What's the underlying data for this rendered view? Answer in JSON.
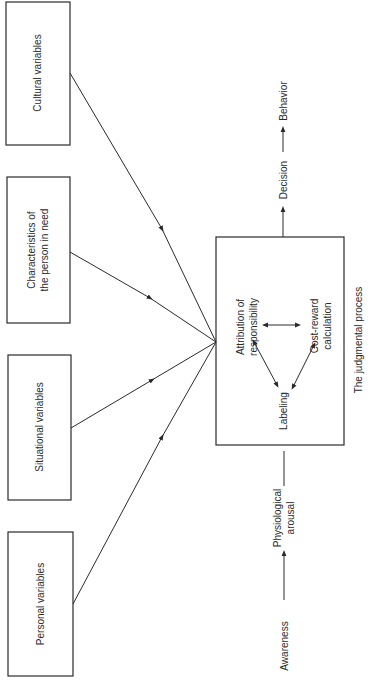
{
  "diagram": {
    "orientation": "rotated-90-ccw",
    "input_boxes": [
      {
        "id": "cultural",
        "lines": [
          "Cultural variables"
        ]
      },
      {
        "id": "characteristics",
        "lines": [
          "Characteristics of",
          "the person in need"
        ]
      },
      {
        "id": "situational",
        "lines": [
          "Situational variables"
        ]
      },
      {
        "id": "personal",
        "lines": [
          "Personal variables"
        ]
      }
    ],
    "process_box": {
      "caption": "The judgmental process",
      "nodes": {
        "attribution": [
          "Attribution of",
          "responsibility"
        ],
        "cost_reward": [
          "Cost-reward",
          "calculation"
        ],
        "labeling": [
          "Labeling"
        ]
      }
    },
    "input_chain": {
      "awareness": "Awareness",
      "arousal": [
        "Physiological",
        "arousal"
      ]
    },
    "output_chain": {
      "decision": "Decision",
      "behavior": "Behavior"
    },
    "colors": {
      "line": "#2a2a2a",
      "background": "#ffffff"
    }
  }
}
